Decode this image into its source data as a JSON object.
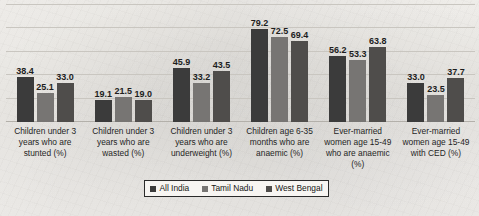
{
  "chart_data": {
    "type": "bar",
    "title": "",
    "xlabel": "",
    "ylabel": "",
    "ylim": [
      0,
      100
    ],
    "grid": true,
    "legend_position": "bottom",
    "categories": [
      "Children under 3 years who are stunted (%)",
      "Children under 3 years who are wasted (%)",
      "Children under 3 years who are underweight (%)",
      "Children age 6-35 months who are anaemic (%)",
      "Ever-married women age 15-49 who are anaemic (%)",
      "Ever-married women age 15-49 with CED (%)"
    ],
    "series": [
      {
        "name": "All India",
        "color": "#3b3b3b",
        "values": [
          38.4,
          19.1,
          45.9,
          79.2,
          56.2,
          33.0
        ]
      },
      {
        "name": "Tamil Nadu",
        "color": "#777573",
        "values": [
          25.1,
          21.5,
          33.2,
          72.5,
          53.3,
          23.5
        ]
      },
      {
        "name": "West Bengal",
        "color": "#4f4d4b",
        "values": [
          33.0,
          19.0,
          43.5,
          69.4,
          63.8,
          37.7
        ]
      }
    ],
    "value_labels": [
      [
        "38.4",
        "25.1",
        "33.0"
      ],
      [
        "19.1",
        "21.5",
        "19.0"
      ],
      [
        "45.9",
        "33.2",
        "43.5"
      ],
      [
        "79.2",
        "72.5",
        "69.4"
      ],
      [
        "56.2",
        "53.3",
        "63.8"
      ],
      [
        "33.0",
        "23.5",
        "37.7"
      ]
    ]
  },
  "legend": {
    "items": [
      {
        "label": "All India"
      },
      {
        "label": "Tamil Nadu"
      },
      {
        "label": "West Bengal"
      }
    ]
  }
}
